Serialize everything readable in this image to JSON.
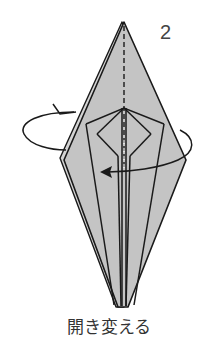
{
  "step": {
    "number": "2",
    "caption": "開き変える"
  },
  "colors": {
    "paper_fill": "#c4c4c4",
    "outline": "#1a1a1a",
    "background": "#ffffff"
  },
  "diagram": {
    "symbols": [
      "valley-fold-dashed-line",
      "rotate-flip-arrow"
    ]
  }
}
